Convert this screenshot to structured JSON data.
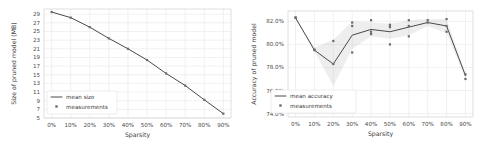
{
  "figure": {
    "panel_count": 2,
    "background": "#ffffff",
    "line_color": "#4a4a4a",
    "marker_color": "#6b6b6b",
    "band_color": "#9a9a9a",
    "grid_color": "#e2e2e4"
  },
  "chart_data": [
    {
      "id": "size-chart",
      "type": "line",
      "title": "",
      "xlabel": "Sparsity",
      "ylabel": "Size of pruned model (MB)",
      "categories": [
        "0%",
        "10%",
        "20%",
        "30%",
        "40%",
        "50%",
        "60%",
        "70%",
        "80%",
        "90%"
      ],
      "x": [
        0,
        10,
        20,
        30,
        40,
        50,
        60,
        70,
        80,
        90
      ],
      "xlim": [
        -4,
        94
      ],
      "ylim": [
        5,
        30.2
      ],
      "ytick_labels": [
        "5",
        "7",
        "9",
        "11",
        "13",
        "15",
        "17",
        "19",
        "21",
        "23",
        "25",
        "27",
        "29"
      ],
      "yticks": [
        5,
        7,
        9,
        11,
        13,
        15,
        17,
        19,
        21,
        23,
        25,
        27,
        29
      ],
      "grid": true,
      "legend_position": "lower left",
      "series": [
        {
          "name": "mean size",
          "kind": "line",
          "values": [
            29.5,
            28.2,
            26.0,
            23.4,
            21.0,
            18.4,
            15.3,
            12.5,
            9.2,
            6.0
          ]
        },
        {
          "name": "measurements",
          "kind": "scatter",
          "values": [
            29.5,
            28.2,
            26.0,
            23.4,
            21.0,
            18.4,
            15.3,
            12.5,
            9.2,
            6.0
          ]
        }
      ],
      "legend": [
        "mean size",
        "measurements"
      ]
    },
    {
      "id": "accuracy-chart",
      "type": "line",
      "title": "",
      "xlabel": "Sparsity",
      "ylabel": "Accuracy of pruned model",
      "categories": [
        "0%",
        "10%",
        "20%",
        "30%",
        "40%",
        "50%",
        "60%",
        "70%",
        "80%",
        "90%"
      ],
      "x": [
        0,
        10,
        20,
        30,
        40,
        50,
        60,
        70,
        80,
        90
      ],
      "xlim": [
        -4,
        94
      ],
      "ylim": [
        73.7,
        82.9
      ],
      "ytick_labels": [
        "74.0%",
        "76.0%",
        "78.0%",
        "80.0%",
        "82.0%"
      ],
      "yticks": [
        74.0,
        76.0,
        78.0,
        80.0,
        82.0
      ],
      "grid": true,
      "legend_position": "lower left",
      "series": [
        {
          "name": "mean accuracy",
          "kind": "line",
          "values": [
            82.3,
            79.5,
            78.3,
            80.8,
            81.3,
            81.1,
            81.5,
            81.9,
            81.6,
            77.3
          ]
        },
        {
          "name": "measurements",
          "kind": "scatter",
          "values": [
            [
              82.3,
              82.35
            ],
            [
              79.5,
              79.55
            ],
            [
              78.3,
              80.3
            ],
            [
              79.3,
              81.6,
              81.9
            ],
            [
              80.9,
              81.1,
              82.1
            ],
            [
              80.0,
              81.5,
              81.7
            ],
            [
              80.7,
              81.6,
              82.1
            ],
            [
              81.9,
              82.1
            ],
            [
              81.1,
              81.6,
              82.2
            ],
            [
              77.0,
              77.4
            ]
          ]
        }
      ],
      "band": {
        "name": "confidence band",
        "lower": [
          82.2,
          79.4,
          76.4,
          79.6,
          80.7,
          80.5,
          80.8,
          81.6,
          81.0,
          77.0
        ],
        "upper": [
          82.4,
          79.7,
          80.4,
          82.0,
          81.9,
          81.8,
          82.1,
          82.2,
          82.2,
          77.5
        ]
      },
      "legend": [
        "mean accuracy",
        "measurements"
      ]
    }
  ]
}
